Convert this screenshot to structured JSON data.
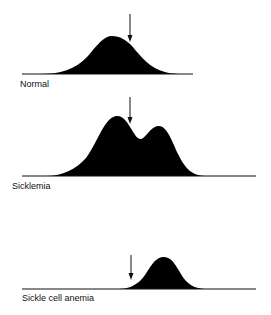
{
  "panels": [
    {
      "label": "Normal",
      "shape": "single peak, centered",
      "arrow_position": "right of peak"
    },
    {
      "label": "Sicklemia",
      "shape": "double peak",
      "arrow_position": "between peaks"
    },
    {
      "label": "Sickle cell anemia",
      "shape": "single peak, shifted right",
      "arrow_position": "left of peak"
    }
  ],
  "colors": {
    "fill": "#000000",
    "line": "#111111",
    "background": "#ffffff"
  }
}
